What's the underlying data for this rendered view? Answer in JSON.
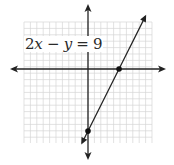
{
  "chart_data": {
    "type": "line",
    "title": "",
    "equation": "2x − y = 9",
    "equation_parts": {
      "coef": "2",
      "x": "x",
      "op": " − ",
      "y": "y",
      "eq": " = ",
      "rhs": "9"
    },
    "xlabel": "",
    "ylabel": "",
    "xlim": [
      -9,
      9
    ],
    "ylim": [
      -10,
      9
    ],
    "grid": true,
    "series": [
      {
        "name": "2x − y = 9",
        "slope": 2,
        "intercept": -9,
        "x": [
          -0.5,
          0,
          4.5,
          8.5
        ],
        "y": [
          -10,
          -9,
          0,
          8
        ]
      }
    ],
    "marked_points": [
      {
        "label": "x-intercept",
        "x": 4.5,
        "y": 0
      },
      {
        "label": "y-intercept",
        "x": 0,
        "y": -9
      }
    ]
  },
  "colors": {
    "grid": "#d6d6d6",
    "axis": "#222222",
    "line": "#222222",
    "point": "#111111",
    "background": "#ffffff"
  }
}
